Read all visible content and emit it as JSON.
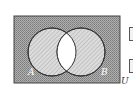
{
  "diagram": {
    "type": "venn",
    "universal_label": "U",
    "sets": [
      {
        "label": "A"
      },
      {
        "label": "B"
      }
    ],
    "shaded_regions": [
      "outside A and B",
      "A only",
      "B only"
    ],
    "unshaded_regions": [
      "A ∩ B"
    ],
    "colors": {
      "outer_fill": "#9a9a9a",
      "circle_fill": "#c8c8c8",
      "intersection_fill": "#ffffff",
      "stroke": "#333333"
    }
  },
  "side_markers": [
    {
      "label": ""
    },
    {
      "label": ""
    }
  ]
}
